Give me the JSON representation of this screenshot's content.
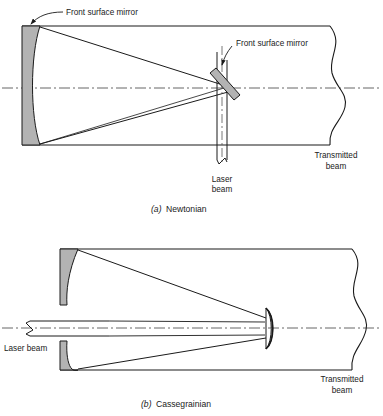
{
  "figure": {
    "colors": {
      "line": "#1a1a1a",
      "mirror_fill": "#b3b3b3",
      "axis": "#555555",
      "background": "#ffffff"
    },
    "panels": [
      {
        "id": "a",
        "caption_marker": "(a)",
        "caption_text": "Newtonian",
        "labels": {
          "primary_mirror": "Front surface mirror",
          "secondary_mirror": "Front surface mirror",
          "laser_line1": "Laser",
          "laser_line2": "beam",
          "transmitted_line1": "Transmitted",
          "transmitted_line2": "beam"
        }
      },
      {
        "id": "b",
        "caption_marker": "(b)",
        "caption_text": "Cassegrainian",
        "labels": {
          "laser_beam": "Laser beam",
          "transmitted_line1": "Transmitted",
          "transmitted_line2": "beam"
        }
      }
    ]
  }
}
